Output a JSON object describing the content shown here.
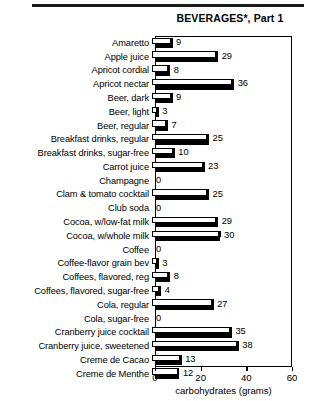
{
  "chart_data": {
    "type": "bar",
    "orientation": "horizontal",
    "title": "BEVERAGES*, Part 1",
    "xlabel": "carbohydrates (grams)",
    "ylabel": "",
    "xlim": [
      0,
      60
    ],
    "xticks": [
      0,
      20,
      40,
      60
    ],
    "grid": false,
    "legend": null,
    "categories": [
      "Amaretto",
      "Apple juice",
      "Apricot cordial",
      "Apricot nectar",
      "Beer, dark",
      "Beer, light",
      "Beer, regular",
      "Breakfast drinks, regular",
      "Breakfast drinks, sugar-free",
      "Carrot juice",
      "Champagne",
      "Clam & tomato cocktail",
      "Club soda",
      "Cocoa, w/low-fat milk",
      "Cocoa, w/whole milk",
      "Coffee",
      "Coffee-flavor grain bev",
      "Coffees, flavored, reg",
      "Coffees, flavored, sugar-free",
      "Cola, regular",
      "Cola, sugar-free",
      "Cranberry juice cocktail",
      "Cranberry juice, sweetened",
      "Creme de Cacao",
      "Creme de Menthe"
    ],
    "values": [
      9,
      29,
      8,
      36,
      9,
      3,
      7,
      25,
      10,
      23,
      0,
      25,
      0,
      29,
      30,
      0,
      3,
      8,
      4,
      27,
      0,
      35,
      38,
      13,
      12
    ]
  },
  "axis": {
    "tick_labels": [
      "0",
      "20",
      "40",
      "60"
    ],
    "title": "carbohydrates (grams)"
  },
  "header": {
    "title": "BEVERAGES*, Part 1"
  }
}
